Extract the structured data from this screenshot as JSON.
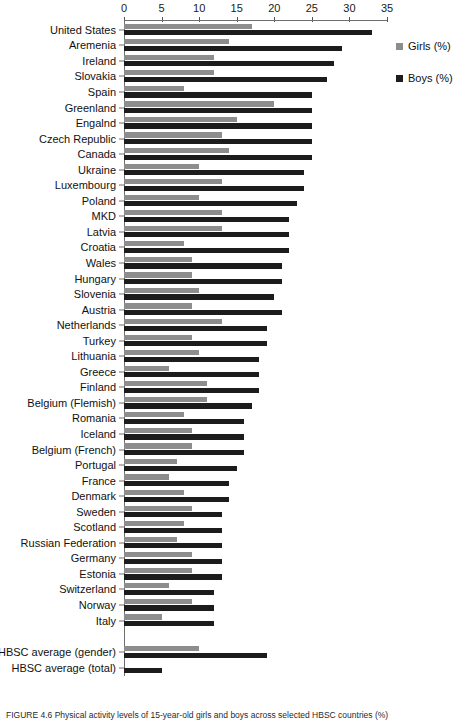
{
  "chart_data": {
    "type": "bar",
    "orientation": "horizontal",
    "title": "",
    "xlabel": "",
    "ylabel": "",
    "xlim": [
      0,
      35
    ],
    "xticks": [
      0,
      5,
      10,
      15,
      20,
      25,
      30,
      35
    ],
    "grid": false,
    "legend_position": "right",
    "series": [
      {
        "name": "Girls (%)",
        "color": "#8d8d8d"
      },
      {
        "name": "Boys (%)",
        "color": "#1c1c1c"
      }
    ],
    "categories": [
      "United States",
      "Aremenia",
      "Ireland",
      "Slovakia",
      "Spain",
      "Greenland",
      "Engalnd",
      "Czech Republic",
      "Canada",
      "Ukraine",
      "Luxembourg",
      "Poland",
      "MKD",
      "Latvia",
      "Croatia",
      "Wales",
      "Hungary",
      "Slovenia",
      "Austria",
      "Netherlands",
      "Turkey",
      "Lithuania",
      "Greece",
      "Finland",
      "Belgium (Flemish)",
      "Romania",
      "Iceland",
      "Belgium (French)",
      "Portugal",
      "France",
      "Denmark",
      "Sweden",
      "Scotland",
      "Russian Federation",
      "Germany",
      "Estonia",
      "Switzerland",
      "Norway",
      "Italy",
      "HBSC average (gender)",
      "HBSC average (total)"
    ],
    "girls": [
      17,
      14,
      12,
      12,
      8,
      20,
      15,
      13,
      14,
      10,
      13,
      10,
      13,
      13,
      8,
      9,
      9,
      10,
      9,
      13,
      9,
      10,
      6,
      11,
      11,
      8,
      9,
      9,
      7,
      6,
      8,
      9,
      8,
      7,
      9,
      9,
      6,
      9,
      5,
      10,
      null
    ],
    "boys": [
      33,
      29,
      28,
      27,
      25,
      25,
      25,
      25,
      25,
      24,
      24,
      23,
      22,
      22,
      22,
      21,
      21,
      20,
      21,
      19,
      19,
      18,
      18,
      18,
      17,
      16,
      16,
      16,
      15,
      14,
      14,
      13,
      13,
      13,
      13,
      13,
      12,
      12,
      12,
      19,
      5
    ]
  },
  "legend": {
    "items": [
      {
        "label": "Girls (%)"
      },
      {
        "label": "Boys (%)"
      }
    ]
  },
  "caption": {
    "text": "FIGURE 4.6   Physical activity levels of 15-year-old girls and boys across selected HBSC countries (%)"
  }
}
